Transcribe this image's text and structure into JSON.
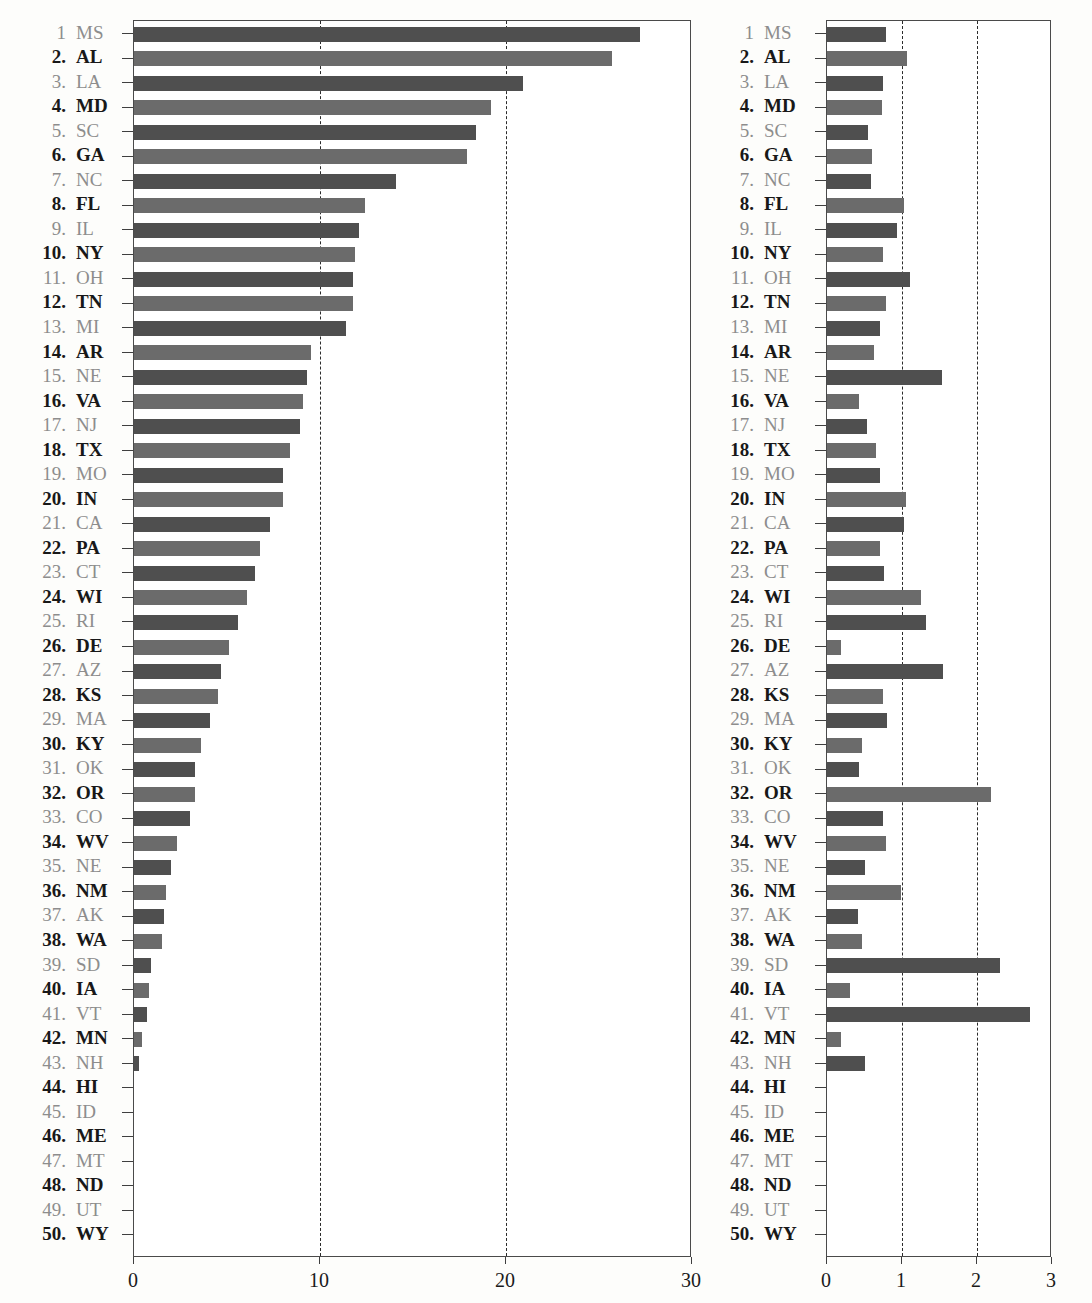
{
  "figure": {
    "kind": "two-panel horizontal bar chart",
    "panels": [
      "left",
      "right"
    ]
  },
  "rows": [
    {
      "rank": "1",
      "abbr": "MS",
      "left": 27.2,
      "right": 0.79
    },
    {
      "rank": "2.",
      "abbr": "AL",
      "left": 25.7,
      "right": 1.07
    },
    {
      "rank": "3.",
      "abbr": "LA",
      "left": 20.9,
      "right": 0.74
    },
    {
      "rank": "4.",
      "abbr": "MD",
      "left": 19.2,
      "right": 0.73
    },
    {
      "rank": "5.",
      "abbr": "SC",
      "left": 18.4,
      "right": 0.55
    },
    {
      "rank": "6.",
      "abbr": "GA",
      "left": 17.9,
      "right": 0.6
    },
    {
      "rank": "7.",
      "abbr": "NC",
      "left": 14.1,
      "right": 0.58
    },
    {
      "rank": "8.",
      "abbr": "FL",
      "left": 12.4,
      "right": 1.03
    },
    {
      "rank": "9.",
      "abbr": "IL",
      "left": 12.1,
      "right": 0.93
    },
    {
      "rank": "10.",
      "abbr": "NY",
      "left": 11.9,
      "right": 0.75
    },
    {
      "rank": "11.",
      "abbr": "OH",
      "left": 11.8,
      "right": 1.11
    },
    {
      "rank": "12.",
      "abbr": "TN",
      "left": 11.8,
      "right": 0.79
    },
    {
      "rank": "13.",
      "abbr": "MI",
      "left": 11.4,
      "right": 0.7
    },
    {
      "rank": "14.",
      "abbr": "AR",
      "left": 9.5,
      "right": 0.62
    },
    {
      "rank": "15.",
      "abbr": "NE",
      "left": 9.3,
      "right": 1.53
    },
    {
      "rank": "16.",
      "abbr": "VA",
      "left": 9.1,
      "right": 0.42
    },
    {
      "rank": "17.",
      "abbr": "NJ",
      "left": 8.9,
      "right": 0.53
    },
    {
      "rank": "18.",
      "abbr": "TX",
      "left": 8.4,
      "right": 0.65
    },
    {
      "rank": "19.",
      "abbr": "MO",
      "left": 8.0,
      "right": 0.7
    },
    {
      "rank": "20.",
      "abbr": "IN",
      "left": 8.0,
      "right": 1.05
    },
    {
      "rank": "21.",
      "abbr": "CA",
      "left": 7.3,
      "right": 1.03
    },
    {
      "rank": "22.",
      "abbr": "PA",
      "left": 6.8,
      "right": 0.7
    },
    {
      "rank": "23.",
      "abbr": "CT",
      "left": 6.5,
      "right": 0.76
    },
    {
      "rank": "24.",
      "abbr": "WI",
      "left": 6.1,
      "right": 1.25
    },
    {
      "rank": "25.",
      "abbr": "RI",
      "left": 5.6,
      "right": 1.32
    },
    {
      "rank": "26.",
      "abbr": "DE",
      "left": 5.1,
      "right": 0.19
    },
    {
      "rank": "27.",
      "abbr": "AZ",
      "left": 4.7,
      "right": 1.55
    },
    {
      "rank": "28.",
      "abbr": "KS",
      "left": 4.5,
      "right": 0.75
    },
    {
      "rank": "29.",
      "abbr": "MA",
      "left": 4.1,
      "right": 0.8
    },
    {
      "rank": "30.",
      "abbr": "KY",
      "left": 3.6,
      "right": 0.46
    },
    {
      "rank": "31.",
      "abbr": "OK",
      "left": 3.3,
      "right": 0.42
    },
    {
      "rank": "32.",
      "abbr": "OR",
      "left": 3.3,
      "right": 2.18
    },
    {
      "rank": "33.",
      "abbr": "CO",
      "left": 3.0,
      "right": 0.74
    },
    {
      "rank": "34.",
      "abbr": "WV",
      "left": 2.3,
      "right": 0.79
    },
    {
      "rank": "35.",
      "abbr": "NE",
      "left": 2.0,
      "right": 0.5
    },
    {
      "rank": "36.",
      "abbr": "NM",
      "left": 1.7,
      "right": 0.98
    },
    {
      "rank": "37.",
      "abbr": "AK",
      "left": 1.6,
      "right": 0.41
    },
    {
      "rank": "38.",
      "abbr": "WA",
      "left": 1.5,
      "right": 0.46
    },
    {
      "rank": "39.",
      "abbr": "SD",
      "left": 0.9,
      "right": 2.3
    },
    {
      "rank": "40.",
      "abbr": "IA",
      "left": 0.8,
      "right": 0.3
    },
    {
      "rank": "41.",
      "abbr": "VT",
      "left": 0.7,
      "right": 2.7
    },
    {
      "rank": "42.",
      "abbr": "MN",
      "left": 0.45,
      "right": 0.18
    },
    {
      "rank": "43.",
      "abbr": "NH",
      "left": 0.25,
      "right": 0.5
    },
    {
      "rank": "44.",
      "abbr": "HI",
      "left": 0,
      "right": 0
    },
    {
      "rank": "45.",
      "abbr": "ID",
      "left": 0,
      "right": 0
    },
    {
      "rank": "46.",
      "abbr": "ME",
      "left": 0,
      "right": 0
    },
    {
      "rank": "47.",
      "abbr": "MT",
      "left": 0,
      "right": 0
    },
    {
      "rank": "48.",
      "abbr": "ND",
      "left": 0,
      "right": 0
    },
    {
      "rank": "49.",
      "abbr": "UT",
      "left": 0,
      "right": 0
    },
    {
      "rank": "50.",
      "abbr": "WY",
      "left": 0,
      "right": 0
    }
  ],
  "chart_data": [
    {
      "type": "bar",
      "orientation": "horizontal",
      "panel": "left",
      "title": "",
      "xlabel": "",
      "ylabel": "",
      "xlim": [
        0,
        30
      ],
      "xticks": [
        0,
        10,
        20,
        30
      ],
      "xtick_labels": [
        "0",
        "10",
        "20",
        "30"
      ],
      "gridlines": [
        10,
        20
      ],
      "grid": "dashed-vertical",
      "legend": "none",
      "categories": [
        "MS",
        "AL",
        "LA",
        "MD",
        "SC",
        "GA",
        "NC",
        "FL",
        "IL",
        "NY",
        "OH",
        "TN",
        "MI",
        "AR",
        "NE",
        "VA",
        "NJ",
        "TX",
        "MO",
        "IN",
        "CA",
        "PA",
        "CT",
        "WI",
        "RI",
        "DE",
        "AZ",
        "KS",
        "MA",
        "KY",
        "OK",
        "OR",
        "CO",
        "WV",
        "NE",
        "NM",
        "AK",
        "WA",
        "SD",
        "IA",
        "VT",
        "MN",
        "NH",
        "HI",
        "ID",
        "ME",
        "MT",
        "ND",
        "UT",
        "WY"
      ],
      "values": [
        27.2,
        25.7,
        20.9,
        19.2,
        18.4,
        17.9,
        14.1,
        12.4,
        12.1,
        11.9,
        11.8,
        11.8,
        11.4,
        9.5,
        9.3,
        9.1,
        8.9,
        8.4,
        8.0,
        8.0,
        7.3,
        6.8,
        6.5,
        6.1,
        5.6,
        5.1,
        4.7,
        4.5,
        4.1,
        3.6,
        3.3,
        3.3,
        3.0,
        2.3,
        2.0,
        1.7,
        1.6,
        1.5,
        0.9,
        0.8,
        0.7,
        0.45,
        0.25,
        0,
        0,
        0,
        0,
        0,
        0,
        0
      ]
    },
    {
      "type": "bar",
      "orientation": "horizontal",
      "panel": "right",
      "title": "",
      "xlabel": "",
      "ylabel": "",
      "xlim": [
        0,
        3
      ],
      "xticks": [
        0,
        1,
        2,
        3
      ],
      "xtick_labels": [
        "0",
        "1",
        "2",
        "3"
      ],
      "gridlines": [
        1,
        2
      ],
      "grid": "dashed-vertical",
      "legend": "none",
      "categories": [
        "MS",
        "AL",
        "LA",
        "MD",
        "SC",
        "GA",
        "NC",
        "FL",
        "IL",
        "NY",
        "OH",
        "TN",
        "MI",
        "AR",
        "NE",
        "VA",
        "NJ",
        "TX",
        "MO",
        "IN",
        "CA",
        "PA",
        "CT",
        "WI",
        "RI",
        "DE",
        "AZ",
        "KS",
        "MA",
        "KY",
        "OK",
        "OR",
        "CO",
        "WV",
        "NE",
        "NM",
        "AK",
        "WA",
        "SD",
        "IA",
        "VT",
        "MN",
        "NH",
        "HI",
        "ID",
        "ME",
        "MT",
        "ND",
        "UT",
        "WY"
      ],
      "values": [
        0.79,
        1.07,
        0.74,
        0.73,
        0.55,
        0.6,
        0.58,
        1.03,
        0.93,
        0.75,
        1.11,
        0.79,
        0.7,
        0.62,
        1.53,
        0.42,
        0.53,
        0.65,
        0.7,
        1.05,
        1.03,
        0.7,
        0.76,
        1.25,
        1.32,
        0.19,
        1.55,
        0.75,
        0.8,
        0.46,
        0.42,
        2.18,
        0.74,
        0.79,
        0.5,
        0.98,
        0.41,
        0.46,
        2.3,
        0.3,
        2.7,
        0.18,
        0.5,
        0,
        0,
        0,
        0,
        0,
        0,
        0
      ]
    }
  ],
  "axes": {
    "left": {
      "labels": [
        "0",
        "10",
        "20",
        "30"
      ]
    },
    "right": {
      "labels": [
        "0",
        "1",
        "2",
        "3"
      ]
    }
  },
  "colors": {
    "bar_odd": "#4f4f4f",
    "bar_even": "#6b6b6b",
    "label_odd": "#8d8d8d",
    "label_even": "#181818",
    "axis": "#3f3f3f",
    "grid": "#2b2b2b",
    "page_bg": "#fdfdfb"
  }
}
